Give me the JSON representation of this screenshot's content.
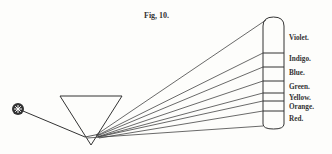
{
  "figure": {
    "title": "Fig, 10.",
    "source_icon": "star-sun-icon",
    "prism": "triangular-prism",
    "spectrum_labels": [
      {
        "label": "Violet.",
        "top": 34
      },
      {
        "label": "Indigo.",
        "top": 55
      },
      {
        "label": "Blue.",
        "top": 69
      },
      {
        "label": "Green.",
        "top": 83
      },
      {
        "label": "Yellow.",
        "top": 94
      },
      {
        "label": "Orange.",
        "top": 103
      },
      {
        "label": "Red.",
        "top": 115
      }
    ]
  }
}
